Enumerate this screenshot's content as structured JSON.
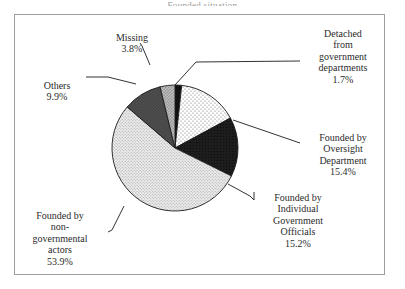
{
  "figure": {
    "title_clipped": "Founded situation",
    "frame_border_color": "#9d9d9d",
    "background": "#ffffff"
  },
  "chart_data": {
    "type": "pie",
    "title": "Founded situation",
    "xlabel": "",
    "ylabel": "",
    "legend_position": "none",
    "labels_outside": true,
    "start_angle_deg": 0,
    "direction": "clockwise",
    "categories": [
      "Detached from government departments",
      "Founded by Oversight Department",
      "Founded by Individual Government Officials",
      "Founded by non-governmental actors",
      "Others",
      "Missing"
    ],
    "values": [
      1.7,
      15.4,
      15.2,
      53.9,
      9.9,
      3.8
    ],
    "value_unit": "percent",
    "slices": [
      {
        "name": "Detached from government departments",
        "label_lines": "Detached\nfrom\ngovernment\ndepartments",
        "percent": "1.7%",
        "value": 1.7,
        "fill": "#111111",
        "pattern": "solid-black"
      },
      {
        "name": "Founded by Oversight Department",
        "label_lines": "Founded by\nOversight\nDepartment",
        "percent": "15.4%",
        "value": 15.4,
        "fill": "#fdfdfd",
        "pattern": "fine-dots"
      },
      {
        "name": "Founded by Individual Government Officials",
        "label_lines": "Founded by\nIndividual\nGovernment\nOfficials",
        "percent": "15.2%",
        "value": 15.2,
        "fill": "#1a1a1a",
        "pattern": "solid-dark"
      },
      {
        "name": "Founded by non-governmental actors",
        "label_lines": "Founded by\nnon-\ngovernmental\nactors",
        "percent": "53.9%",
        "value": 53.9,
        "fill": "#e3e3e3",
        "pattern": "light-stipple"
      },
      {
        "name": "Others",
        "label_lines": "Others",
        "percent": "9.9%",
        "value": 9.9,
        "fill": "#4a4a4a",
        "pattern": "dark-gray"
      },
      {
        "name": "Missing",
        "label_lines": "Missing",
        "percent": "3.8%",
        "value": 3.8,
        "fill": "#b0b0b0",
        "pattern": "medium-stipple"
      }
    ]
  }
}
